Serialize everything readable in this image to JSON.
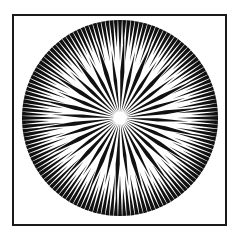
{
  "figure": {
    "type": "siemens-star-radial-pattern",
    "ink_color": "#111111",
    "background_color": "#ffffff",
    "frame": {
      "present": true,
      "color": "#1a1a1a"
    },
    "star": {
      "center": [
        120,
        118
      ],
      "outer_radius": 98,
      "outer_spokes": 144,
      "inner_spokes": 36
    }
  }
}
